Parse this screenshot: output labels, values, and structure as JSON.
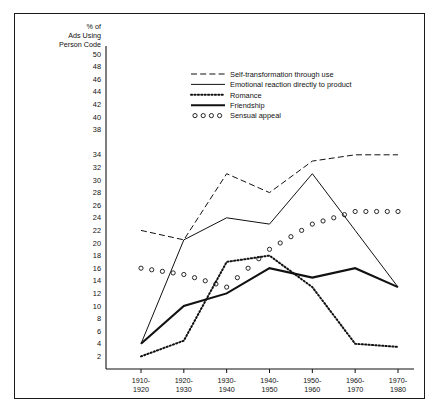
{
  "chart_data": {
    "type": "line",
    "title": "",
    "ylabel": "% of\nAds Using\nPerson Code",
    "ylabel_lines": [
      "% of",
      "Ads Using",
      "Person Code"
    ],
    "xlabel": "",
    "categories": [
      "1910-\n1920",
      "1920-\n1930",
      "1930-\n1940",
      "1940-\n1950",
      "1950-\n1960",
      "1960-\n1970",
      "1970-\n1980"
    ],
    "category_lines": [
      [
        "1910-",
        "1920"
      ],
      [
        "1920-",
        "1930"
      ],
      [
        "1930-",
        "1940"
      ],
      [
        "1940-",
        "1950"
      ],
      [
        "1950-",
        "1960"
      ],
      [
        "1960-",
        "1970"
      ],
      [
        "1970-",
        "1980"
      ]
    ],
    "ylim": [
      0,
      50
    ],
    "ytick_values": [
      2,
      4,
      6,
      8,
      10,
      12,
      14,
      16,
      18,
      20,
      22,
      24,
      26,
      28,
      30,
      32,
      34,
      38,
      40,
      42,
      44,
      46,
      48,
      50
    ],
    "ytick_labels": [
      "2",
      "4",
      "6",
      "8",
      "10",
      "12",
      "14",
      "16",
      "18",
      "20",
      "22",
      "24",
      "26",
      "28",
      "30",
      "32",
      "34",
      "38",
      "40",
      "42",
      "44",
      "46",
      "48",
      "50"
    ],
    "grid": false,
    "legend_position": "upper-center",
    "series": [
      {
        "name": "Self-transformation through use",
        "style": "dashed",
        "values": [
          22,
          20.5,
          31,
          28,
          33,
          34,
          34
        ]
      },
      {
        "name": "Emotional reaction directly to product",
        "style": "solid-thin",
        "values": [
          4,
          20.5,
          24,
          23,
          31,
          22,
          13
        ]
      },
      {
        "name": "Romance",
        "style": "dotted",
        "values": [
          2,
          4.5,
          17,
          18,
          13,
          4,
          3.5
        ]
      },
      {
        "name": "Friendship",
        "style": "solid-thick",
        "values": [
          4,
          10,
          12,
          16,
          14.5,
          16,
          13
        ]
      },
      {
        "name": "Sensual appeal",
        "style": "circles",
        "values": [
          16,
          15,
          13,
          19,
          23,
          25,
          25
        ]
      }
    ]
  },
  "colors": {
    "ink": "#111111",
    "frame": "#1a1a1a",
    "background": "#ffffff"
  }
}
